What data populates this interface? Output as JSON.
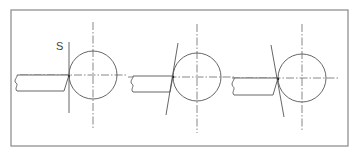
{
  "diagram": {
    "type": "technical-drawing",
    "colors": {
      "line": "#555555",
      "frame": "#888888",
      "background": "#ffffff"
    },
    "label_s": "S",
    "frame": {
      "x": 11,
      "y": 10,
      "w": 337,
      "h": 136
    },
    "panels": [
      {
        "name": "panel-1",
        "circle": {
          "cx": 93,
          "cy": 75,
          "r": 24
        },
        "v_center": {
          "x": 93,
          "y1": 22,
          "y2": 130
        },
        "h_center": {
          "x1": 20,
          "x2": 128,
          "y": 75
        },
        "plane_line": {
          "x1": 69,
          "y1": 42,
          "x2": 69,
          "y2": 113
        },
        "tool": {
          "x_left": 15,
          "y_top": 75,
          "y_bot": 91,
          "tip_x": 69,
          "bot_x": 64
        }
      },
      {
        "name": "panel-2",
        "circle": {
          "cx": 197,
          "cy": 77,
          "r": 24
        },
        "v_center": {
          "x": 197,
          "y1": 24,
          "y2": 133
        },
        "h_center": {
          "x1": 128,
          "x2": 235,
          "y": 77
        },
        "plane_line": {
          "x1": 178,
          "y1": 43,
          "x2": 166,
          "y2": 115
        },
        "tool": {
          "x_left": 131,
          "y_top": 76,
          "y_bot": 92,
          "tip_x": 173,
          "bot_x": 170
        }
      },
      {
        "name": "panel-3",
        "circle": {
          "cx": 302,
          "cy": 78,
          "r": 24
        },
        "v_center": {
          "x": 302,
          "y1": 24,
          "y2": 132
        },
        "h_center": {
          "x1": 232,
          "x2": 340,
          "y": 78
        },
        "plane_line": {
          "x1": 271,
          "y1": 45,
          "x2": 284,
          "y2": 117
        },
        "tool": {
          "x_left": 232,
          "y_top": 78,
          "y_bot": 95,
          "tip_x": 278,
          "bot_x": 273
        }
      }
    ]
  }
}
